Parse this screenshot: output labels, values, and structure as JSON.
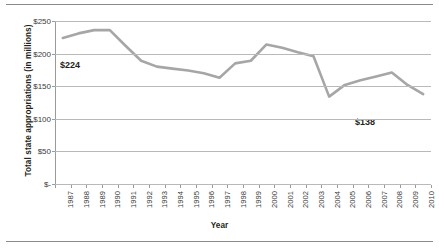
{
  "chart_data": {
    "type": "line",
    "title": "",
    "xlabel": "Year",
    "ylabel": "Total state appropriations (in millions)",
    "ylim": [
      0,
      250
    ],
    "ytick_labels": [
      "$250",
      "$200",
      "$150",
      "$100",
      "$50",
      "$-"
    ],
    "ytick_values": [
      250,
      200,
      150,
      100,
      50,
      0
    ],
    "grid": true,
    "legend": "none",
    "line_color": "#a6a6a6",
    "categories": [
      "1987",
      "1988",
      "1989",
      "1990",
      "1991",
      "1992",
      "1993",
      "1994",
      "1995",
      "1996",
      "1997",
      "1998",
      "1999",
      "2000",
      "2001",
      "2002",
      "2003",
      "2004",
      "2005",
      "2006",
      "2007",
      "2008",
      "2009",
      "2010"
    ],
    "values": [
      224,
      231,
      236,
      236,
      212,
      189,
      180,
      177,
      174,
      170,
      163,
      185,
      189,
      214,
      209,
      202,
      196,
      134,
      152,
      159,
      165,
      171,
      152,
      138
    ],
    "annotations": [
      {
        "label": "$224",
        "point": "1987",
        "value": 224
      },
      {
        "label": "$138",
        "point": "2010",
        "value": 138
      }
    ]
  }
}
